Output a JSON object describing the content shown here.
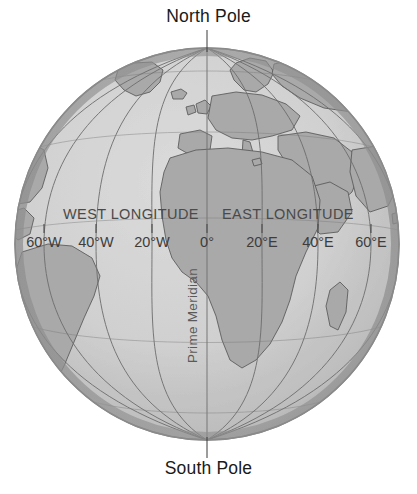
{
  "figure": {
    "type": "globe-longitude-diagram",
    "north_pole_label": "North Pole",
    "south_pole_label": "South Pole",
    "prime_meridian_label": "Prime Meridian",
    "west_hemisphere_label": "WEST LONGITUDE",
    "east_hemisphere_label": "EAST LONGITUDE"
  },
  "longitude_ticks": [
    {
      "label": "60°W",
      "x": 44
    },
    {
      "label": "40°W",
      "x": 96
    },
    {
      "label": "20°W",
      "x": 152
    },
    {
      "label": "0°",
      "x": 207
    },
    {
      "label": "20°E",
      "x": 262
    },
    {
      "label": "40°E",
      "x": 318
    },
    {
      "label": "60°E",
      "x": 371
    }
  ],
  "colors": {
    "ocean": "#d0d0d0",
    "land": "#a9a9a9",
    "globe_edge": "#8a8a8a",
    "meridian_line": "#6e6e6e",
    "pole_text": "#1a1a1a",
    "map_text": "#4a4a4a",
    "background": "#ffffff"
  },
  "geometry": {
    "center_x": 207,
    "center_y": 244,
    "radius_x": 192,
    "radius_y": 196
  }
}
